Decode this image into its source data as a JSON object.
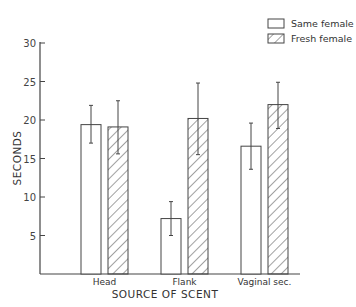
{
  "chart_data": {
    "type": "bar",
    "title": "",
    "xlabel": "SOURCE OF SCENT",
    "ylabel": "SECONDS",
    "ylim": [
      0,
      30
    ],
    "yticks": [
      5,
      10,
      15,
      20,
      25,
      30
    ],
    "ytick_labels": [
      "5",
      "10",
      "15",
      "20",
      "25",
      "30"
    ],
    "grid": false,
    "legend_position": "top-right",
    "categories": [
      "Head",
      "Flank",
      "Vaginal sec."
    ],
    "series": [
      {
        "name": "Same female",
        "pattern": "open",
        "values": [
          19.4,
          7.2,
          16.6
        ],
        "error_high": [
          21.9,
          9.4,
          19.6
        ],
        "error_low": [
          17.0,
          5.0,
          13.6
        ]
      },
      {
        "name": "Fresh female",
        "pattern": "hatched",
        "values": [
          19.1,
          20.2,
          22.0
        ],
        "error_high": [
          22.5,
          24.8,
          24.9
        ],
        "error_low": [
          15.6,
          15.5,
          18.9
        ]
      }
    ]
  },
  "colors": {
    "ink": "#333333",
    "background": "#ffffff"
  }
}
